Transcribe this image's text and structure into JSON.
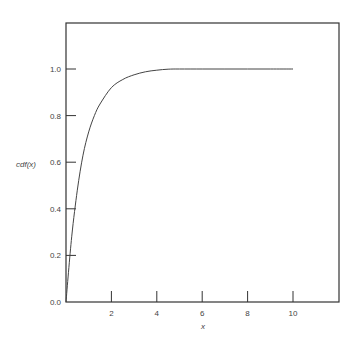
{
  "chart_data": {
    "type": "line",
    "title": "",
    "xlabel": "x",
    "ylabel": "cdf(x)",
    "xlim": [
      0,
      12
    ],
    "ylim": [
      0,
      1.2
    ],
    "grid": false,
    "x_ticks": [
      2,
      4,
      6,
      8,
      10
    ],
    "x_tick_labels": [
      "2",
      "4",
      "6",
      "8",
      "10"
    ],
    "y_ticks": [
      0.0,
      0.2,
      0.4,
      0.6,
      0.8,
      1.0
    ],
    "y_tick_labels": [
      "0.0",
      "0.2",
      "0.4",
      "0.6",
      "0.8",
      "1.0"
    ],
    "series": [
      {
        "name": "cdf(x)",
        "x": [
          0,
          0.25,
          0.5,
          0.75,
          1.0,
          1.25,
          1.5,
          2.0,
          2.5,
          3.0,
          3.5,
          4.0,
          4.5,
          5.0,
          6.0,
          7.0,
          8.0,
          9.0,
          10.0
        ],
        "values": [
          0.0,
          0.28,
          0.48,
          0.63,
          0.73,
          0.8,
          0.85,
          0.92,
          0.955,
          0.975,
          0.988,
          0.995,
          0.999,
          1.0,
          1.0,
          1.0,
          1.0,
          1.0,
          1.0
        ]
      }
    ]
  }
}
